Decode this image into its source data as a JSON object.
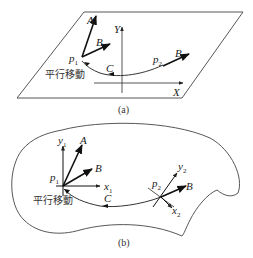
{
  "figure_a": {
    "caption": "(a)",
    "plane": "flat plane",
    "labels": {
      "A": "A",
      "B1": "B",
      "B2": "B",
      "C": "C",
      "p1": "p",
      "p1_sub": "1",
      "p2": "p",
      "p2_sub": "2",
      "Y": "Y",
      "X": "X",
      "parallel_transport": "平行移動"
    }
  },
  "figure_b": {
    "caption": "(b)",
    "plane": "curved surface",
    "labels": {
      "A": "A",
      "B1": "B",
      "B2": "B",
      "C": "C",
      "p1": "p",
      "p1_sub": "1",
      "p2": "p",
      "p2_sub": "2",
      "y1": "y",
      "y1_sub": "1",
      "x1": "x",
      "x1_sub": "1",
      "y2": "y",
      "y2_sub": "2",
      "x2": "x",
      "x2_sub": "2",
      "parallel_transport": "平行移動"
    }
  }
}
